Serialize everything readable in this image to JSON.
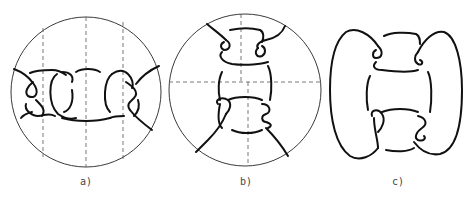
{
  "figure": {
    "panels": [
      {
        "id": "a",
        "label": "a)",
        "description": "knot diagram in a disk with three vertical dashed cut lines",
        "label_x": 86
      },
      {
        "id": "b",
        "label": "b)",
        "description": "knot diagram in a disk with horizontal and vertical dashed cut lines",
        "label_x": 246
      },
      {
        "id": "c",
        "label": "c)",
        "description": "closed knot diagram without disk",
        "label_x": 398
      }
    ],
    "colors": {
      "strand": "#111111",
      "circle": "#3a3a3a",
      "dash": "#555555",
      "background": "#ffffff"
    }
  }
}
